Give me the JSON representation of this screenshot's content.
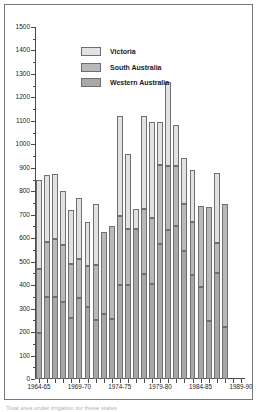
{
  "figure": {
    "caption_partial": "Total area under  irrigation for these states"
  },
  "legend": {
    "position": "top-left-inside",
    "items": [
      {
        "label": "Victoria",
        "color": "#e2e2e2",
        "key": "vic"
      },
      {
        "label": "South Australia",
        "color": "#b9b9b9",
        "key": "sa"
      },
      {
        "label": "Western Australia",
        "color": "#a8a8a8",
        "key": "wa"
      }
    ]
  },
  "axes": {
    "y_ticks": [
      0,
      100,
      200,
      300,
      400,
      500,
      600,
      700,
      800,
      900,
      1000,
      1100,
      1200,
      1300,
      1400,
      1500
    ],
    "y_min": 0,
    "y_max": 1500,
    "x_tick_labels": [
      "1964-65",
      "1969-70",
      "1974-75",
      "1979-80",
      "1984-85",
      "1989-90"
    ],
    "x_tick_indices": [
      0,
      5,
      10,
      15,
      20,
      25
    ],
    "grid": false
  },
  "chart_data": {
    "type": "bar",
    "stacked": true,
    "title": "",
    "xlabel": "",
    "ylabel": "",
    "ylim": [
      0,
      1500
    ],
    "categories": [
      "1964-65",
      "1965-66",
      "1966-67",
      "1967-68",
      "1968-69",
      "1969-70",
      "1970-71",
      "1971-72",
      "1972-73",
      "1973-74",
      "1974-75",
      "1975-76",
      "1976-77",
      "1977-78",
      "1978-79",
      "1979-80",
      "1980-81",
      "1981-82",
      "1982-83",
      "1983-84",
      "1984-85",
      "1985-86",
      "1986-87",
      "1987-88",
      "1988-89",
      "1989-90"
    ],
    "series": [
      {
        "name": "Western Australia",
        "color": "#a8a8a8",
        "values": [
          198,
          350,
          348,
          330,
          262,
          346,
          305,
          252,
          275,
          254,
          400,
          400,
          640,
          448,
          403,
          575,
          635,
          650,
          545,
          443,
          390,
          246,
          450,
          220,
          0,
          0
        ]
      },
      {
        "name": "South Australia",
        "color": "#b9b9b9",
        "values": [
          272,
          233,
          250,
          240,
          230,
          167,
          178,
          232,
          350,
          398,
          295,
          238,
          0,
          277,
          285,
          337,
          272,
          258,
          202,
          227,
          348,
          487,
          130,
          527,
          0,
          0
        ]
      },
      {
        "name": "Victoria",
        "color": "#e2e2e2",
        "values": [
          378,
          288,
          274,
          232,
          228,
          257,
          185,
          263,
          0,
          0,
          425,
          320,
          85,
          395,
          408,
          183,
          360,
          175,
          193,
          220,
          0,
          0,
          300,
          0,
          0,
          0
        ]
      }
    ],
    "totals": [
      848,
      871,
      872,
      802,
      720,
      770,
      668,
      747,
      625,
      652,
      1120,
      958,
      725,
      1120,
      1096,
      1095,
      1267,
      1083,
      940,
      890,
      738,
      733,
      880,
      747,
      0,
      0
    ]
  }
}
